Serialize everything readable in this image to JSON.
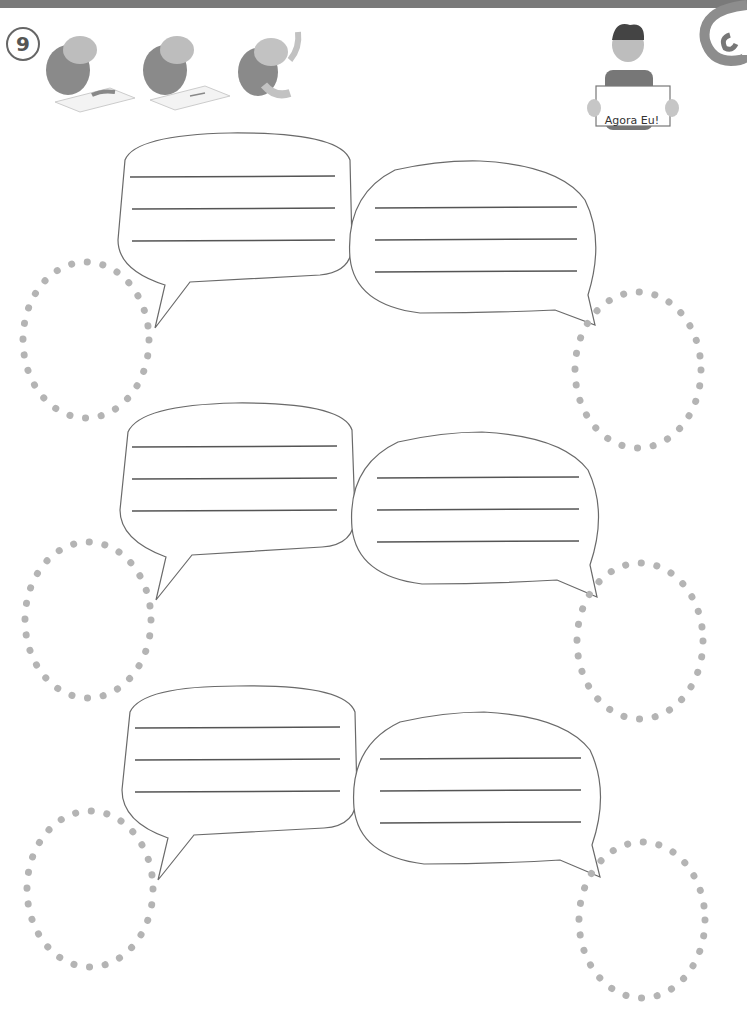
{
  "header": {
    "exercise_number": "9",
    "instruction_icons": [
      "turtle-drawing-icon",
      "turtle-writing-icon",
      "turtle-raising-hand-icon"
    ],
    "sign_text": "Agora Eu!"
  },
  "rows": [
    {
      "left_bubble": {
        "lines": 3
      },
      "right_bubble": {
        "lines": 3
      },
      "left_portrait": "empty dotted circle",
      "right_portrait": "empty dotted circle"
    },
    {
      "left_bubble": {
        "lines": 3
      },
      "right_bubble": {
        "lines": 3
      },
      "left_portrait": "empty dotted circle",
      "right_portrait": "empty dotted circle"
    },
    {
      "left_bubble": {
        "lines": 3
      },
      "right_bubble": {
        "lines": 3
      },
      "left_portrait": "empty dotted circle",
      "right_portrait": "empty dotted circle"
    }
  ],
  "colors": {
    "stroke": "#6a6a6a",
    "dots": "#b4b4b4",
    "band": "#7a7a7a"
  }
}
